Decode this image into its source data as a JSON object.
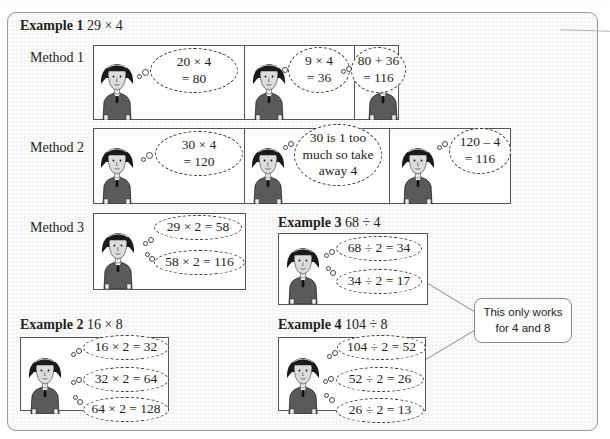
{
  "example1": {
    "label": "Example 1",
    "expression": "29 × 4",
    "methods": [
      {
        "label": "Method 1",
        "thoughts": [
          "20 × 4\n= 80",
          "9 × 4\n= 36",
          "80 + 36\n= 116"
        ]
      },
      {
        "label": "Method 2",
        "thoughts": [
          "30 × 4\n= 120",
          "30 is 1 too\nmuch so take\naway 4",
          "120 – 4\n= 116"
        ]
      },
      {
        "label": "Method 3",
        "thoughts": [
          "29 × 2 = 58",
          "58 × 2 = 116"
        ]
      }
    ]
  },
  "example2": {
    "label": "Example 2",
    "expression": "16 × 8",
    "thoughts": [
      "16 × 2 = 32",
      "32 × 2 = 64",
      "64 × 2 = 128"
    ]
  },
  "example3": {
    "label": "Example 3",
    "expression": "68 ÷ 4",
    "thoughts": [
      "68 ÷ 2 = 34",
      "34 ÷ 2 = 17"
    ]
  },
  "example4": {
    "label": "Example 4",
    "expression": "104 ÷ 8",
    "thoughts": [
      "104 ÷ 2 = 52",
      "52 ÷ 2 = 26",
      "26 ÷ 2 = 13"
    ]
  },
  "callout": {
    "text": "This only works\nfor 4 and 8"
  },
  "colors": {
    "border": "#9a9a9a",
    "panel_border": "#555555",
    "sweater": "#5a5a5a",
    "hair": "#1a1a1a"
  }
}
